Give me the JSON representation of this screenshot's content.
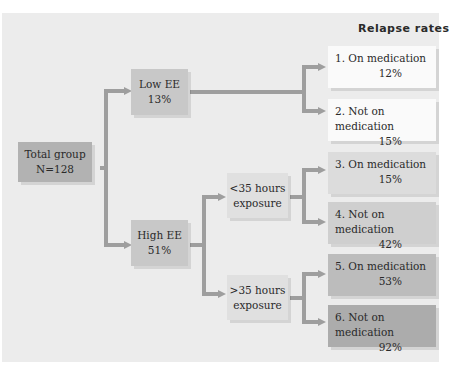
{
  "diagram": {
    "title": "Relapse rates",
    "root": {
      "label": "Total group",
      "value": "N=128",
      "color": "#b2b2b2"
    },
    "ee_groups": [
      {
        "label": "Low EE",
        "value": "13%",
        "color": "#c8c8c8"
      },
      {
        "label": "High EE",
        "value": "51%",
        "color": "#c8c8c8"
      }
    ],
    "exposure_groups": [
      {
        "line1": "<35 hours",
        "line2": "exposure",
        "color": "#e0e0e0"
      },
      {
        "line1": ">35 hours",
        "line2": "exposure",
        "color": "#e0e0e0"
      }
    ],
    "outcomes": [
      {
        "label": "1. On medication",
        "rate": "12%",
        "color": "#fafafa"
      },
      {
        "label": "2. Not on medication",
        "rate": "15%",
        "color": "#fafafa"
      },
      {
        "label": "3. On medication",
        "rate": "15%",
        "color": "#dcdcdc"
      },
      {
        "label": "4. Not on medication",
        "rate": "42%",
        "color": "#cfcfcf"
      },
      {
        "label": "5. On medication",
        "rate": "53%",
        "color": "#bcbcbc"
      },
      {
        "label": "6. Not on medication",
        "rate": "92%",
        "color": "#acacac"
      }
    ],
    "connector_color": "#9e9e9e",
    "background_color": "#ececec"
  }
}
